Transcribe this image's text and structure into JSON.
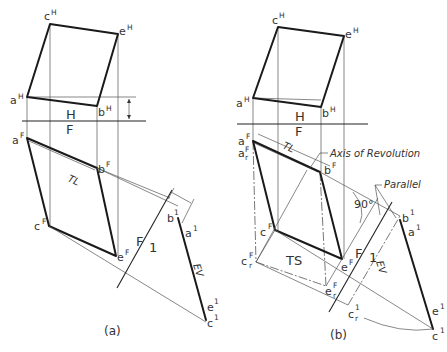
{
  "figure": {
    "panel_a": {
      "caption": "(a)",
      "labels": {
        "cH": "c",
        "cH_sup": "H",
        "eH": "e",
        "eH_sup": "H",
        "aH": "a",
        "aH_sup": "H",
        "bH": "b",
        "bH_sup": "H",
        "fold_HF_top": "H",
        "fold_HF_bottom": "F",
        "aF": "a",
        "aF_sup": "F",
        "bF": "b",
        "bF_sup": "F",
        "cF": "c",
        "cF_sup": "F",
        "eF": "e",
        "eF_sup": "F",
        "TL": "TL",
        "fold_F1_left": "F",
        "fold_F1_right": "1",
        "b1": "b",
        "b1_sup": "1",
        "a1": "a",
        "a1_sup": "1",
        "e1": "e",
        "e1_sup": "1",
        "c1": "c",
        "c1_sup": "1",
        "EV": "EV",
        "dim_D": "D"
      }
    },
    "panel_b": {
      "caption": "(b)",
      "labels": {
        "cH": "c",
        "cH_sup": "H",
        "eH": "e",
        "eH_sup": "H",
        "aH": "a",
        "aH_sup": "H",
        "bH": "b",
        "bH_sup": "H",
        "fold_HF_top": "H",
        "fold_HF_bottom": "F",
        "aF": "a",
        "aF_sup": "F",
        "arF": "a",
        "arF_sub": "r",
        "arF_sup": "F",
        "bF": "b",
        "bF_sup": "F",
        "cF": "c",
        "cF_sup": "F",
        "eF": "e",
        "eF_sup": "F",
        "crF": "c",
        "crF_sub": "r",
        "crF_sup": "F",
        "erF": "e",
        "erF_sub": "r",
        "erF_sup": "F",
        "TL": "TL",
        "TS": "TS",
        "axis_of_revolution": "Axis of Revolution",
        "parallel": "Parallel",
        "angle_90": "90°",
        "fold_F1_left": "F",
        "fold_F1_right": "1",
        "b1": "b",
        "b1_sup": "1",
        "a1": "a",
        "a1_sup": "1",
        "e1": "e",
        "e1_sup": "1",
        "c1": "c",
        "c1_sup": "1",
        "c1r": "c",
        "c1r_sub": "r",
        "c1r_sup": "1",
        "EV": "EV"
      }
    }
  },
  "colors": {
    "line": "#1a1a1a",
    "thin_line": "#555555",
    "text": "#333333",
    "background": "#ffffff"
  }
}
